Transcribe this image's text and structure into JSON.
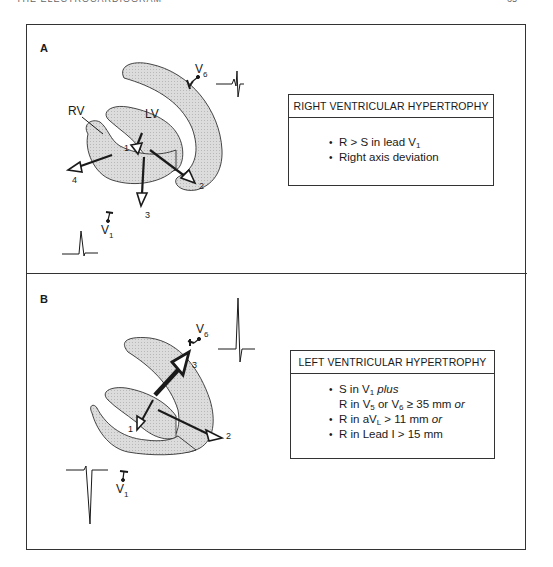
{
  "page": {
    "running_header": "THE ELECTROCARDIOGRAM",
    "page_number": "65"
  },
  "panel_a": {
    "label": "A",
    "labels": {
      "rv": "RV",
      "lv": "LV",
      "v6": "V",
      "v6_sub": "6",
      "v1": "V",
      "v1_sub": "1"
    },
    "vectors": [
      "1",
      "2",
      "3",
      "4"
    ],
    "box": {
      "title": "RIGHT VENTRICULAR HYPERTROPHY",
      "criteria": [
        {
          "pre": "R > S  in lead V",
          "sub": "1",
          "post": ""
        },
        {
          "pre": "Right axis deviation",
          "sub": "",
          "post": ""
        }
      ]
    }
  },
  "panel_b": {
    "label": "B",
    "labels": {
      "v6": "V",
      "v6_sub": "6",
      "v1": "V",
      "v1_sub": "1"
    },
    "vectors": [
      "1",
      "2",
      "3"
    ],
    "box": {
      "title": "LEFT VENTRICULAR HYPERTROPHY",
      "criteria": [
        {
          "a": "S in V",
          "a_sub": "1",
          "a_em": " plus"
        },
        {
          "b1": "R in V",
          "b1_sub": "5",
          "b2": " or V",
          "b2_sub": "6",
          "b3": " ≥ 35 mm",
          "b_em": " or"
        },
        {
          "c": "R in aV",
          "c_sub": "L",
          "c2": " > 11 mm",
          "c_em": " or"
        },
        {
          "d": "R in Lead  I > 15 mm"
        }
      ]
    }
  },
  "colors": {
    "stroke": "#1a1a1a",
    "fill_myocardium": "#d4d4d4",
    "frame": "#333333"
  }
}
